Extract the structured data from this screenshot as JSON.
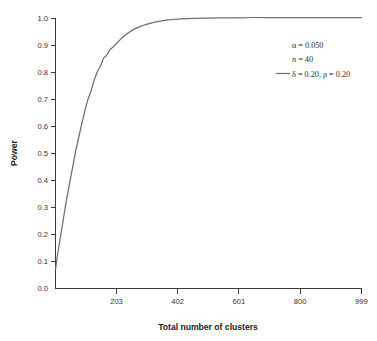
{
  "chart_data": {
    "type": "line",
    "title": "",
    "xlabel": "Total number of clusters",
    "ylabel": "Power",
    "xlim": [
      4,
      999
    ],
    "ylim": [
      0.0,
      1.0
    ],
    "grid": false,
    "x_ticks": [
      203,
      402,
      601,
      800,
      999
    ],
    "x_tick_labels": [
      "203",
      "402",
      "601",
      "800",
      "999"
    ],
    "y_ticks": [
      0.0,
      0.1,
      0.2,
      0.3,
      0.4,
      0.5,
      0.6,
      0.7,
      0.8,
      0.9,
      1.0
    ],
    "y_tick_labels": [
      "0.0",
      "0.1",
      "0.2",
      "0.3",
      "0.4",
      "0.5",
      "0.6",
      "0.7",
      "0.8",
      "0.9",
      "1.0"
    ],
    "legend_position": "upper right",
    "series": [
      {
        "name": "δ = 0.20, ρ = 0.20",
        "color": "#6e6e6e",
        "x": [
          4,
          10,
          20,
          30,
          40,
          50,
          60,
          70,
          80,
          90,
          100,
          110,
          120,
          130,
          140,
          150,
          160,
          170,
          180,
          190,
          203,
          220,
          240,
          260,
          280,
          300,
          320,
          340,
          360,
          380,
          402,
          430,
          460,
          500,
          540,
          580,
          601,
          650,
          700,
          750,
          800,
          860,
          920,
          999
        ],
        "y": [
          0.07,
          0.12,
          0.19,
          0.26,
          0.33,
          0.39,
          0.45,
          0.51,
          0.56,
          0.61,
          0.66,
          0.7,
          0.73,
          0.77,
          0.8,
          0.82,
          0.85,
          0.86,
          0.88,
          0.89,
          0.905,
          0.925,
          0.943,
          0.957,
          0.967,
          0.975,
          0.981,
          0.986,
          0.989,
          0.992,
          0.994,
          0.996,
          0.997,
          0.998,
          0.999,
          0.999,
          0.999,
          1.0,
          1.0,
          1.0,
          1.0,
          1.0,
          1.0,
          1.0
        ]
      }
    ],
    "annotations": [
      {
        "text": "α = 0.050",
        "style": "plain"
      },
      {
        "text": "n = 40",
        "style": "italic-n"
      },
      {
        "text": "δ = 0.20, ρ = 0.20",
        "style": "with-line-sample"
      }
    ],
    "annotation_parts": {
      "alpha_line": "α = 0.050",
      "n_symbol": "n",
      "n_value": " = 40",
      "delta_line": "δ = 0.20, ρ = 0.20"
    }
  },
  "axes": {
    "x_title": "Total number of clusters",
    "y_title": "Power"
  }
}
